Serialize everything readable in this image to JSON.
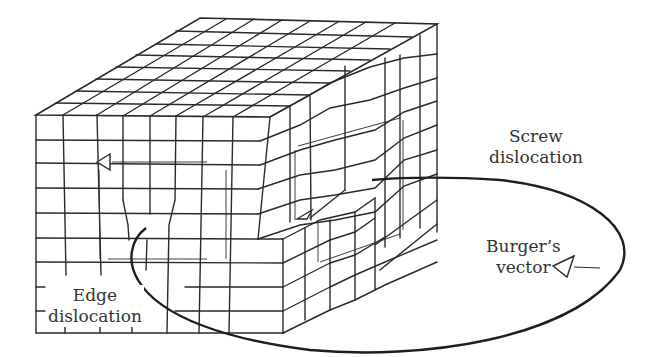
{
  "figure": {
    "type": "crystal lattice dislocation diagram",
    "labels": {
      "screw": [
        "Screw",
        "dislocation"
      ],
      "edge": [
        "Edge",
        "dislocation"
      ],
      "burgers": [
        "Burger’s",
        "vector"
      ]
    },
    "colors": {
      "line": "#2a2a2a",
      "text": "#333333",
      "background": "#ffffff"
    }
  }
}
